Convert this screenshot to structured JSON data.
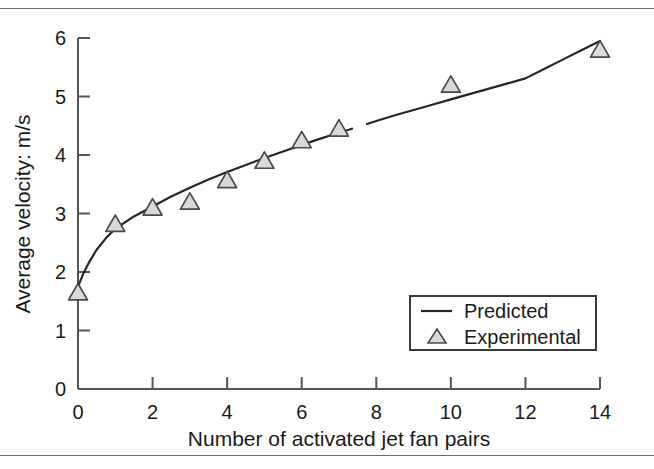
{
  "figure": {
    "background_color": "#ffffff",
    "rule_color": "#6e6e6e",
    "axis_color": "#555555",
    "curve_color": "#262626",
    "marker_fill": "#d9d9d9",
    "marker_stroke": "#4a4a4a"
  },
  "chart_data": {
    "type": "line",
    "title": "",
    "xlabel": "Number of activated jet fan pairs",
    "ylabel": "Average velocity: m/s",
    "xlim": [
      0,
      14
    ],
    "ylim": [
      0,
      6
    ],
    "xticks": [
      0,
      2,
      4,
      6,
      8,
      10,
      12,
      14
    ],
    "xticklabels": [
      "0",
      "2",
      "4",
      "6",
      "8",
      "10",
      "12",
      "14"
    ],
    "yticks": [
      0,
      1,
      2,
      3,
      4,
      5,
      6
    ],
    "yticklabels": [
      "0",
      "1",
      "2",
      "3",
      "4",
      "5",
      "6"
    ],
    "grid": false,
    "legend_position": "lower right",
    "series": [
      {
        "name": "Predicted",
        "marker": "none",
        "style": "solid-line",
        "x": [
          0.0,
          0.15,
          0.3,
          0.5,
          0.75,
          1.0,
          1.5,
          2.0,
          2.5,
          3.0,
          3.5,
          4.0,
          4.5,
          5.0,
          5.5,
          6.0,
          6.5,
          7.0,
          7.5,
          8.0,
          8.5,
          9.0,
          9.5,
          10.0,
          10.5,
          11.0,
          11.5,
          12.0,
          12.5,
          13.0,
          13.5,
          14.0
        ],
        "y": [
          1.75,
          1.98,
          2.17,
          2.38,
          2.58,
          2.74,
          2.95,
          3.12,
          3.29,
          3.44,
          3.58,
          3.71,
          3.83,
          3.95,
          4.06,
          4.17,
          4.28,
          4.38,
          4.48,
          4.58,
          4.68,
          4.77,
          4.86,
          4.95,
          5.04,
          5.13,
          5.22,
          5.31,
          5.47,
          5.63,
          5.79,
          5.95
        ]
      },
      {
        "name": "Experimental",
        "marker": "triangle-up",
        "style": "markers-only",
        "x": [
          0,
          1,
          2,
          3,
          4,
          5,
          6,
          7,
          10,
          14
        ],
        "y": [
          1.65,
          2.82,
          3.1,
          3.2,
          3.57,
          3.9,
          4.25,
          4.45,
          5.2,
          5.8
        ]
      }
    ],
    "annotations": [
      {
        "type": "curve-gap",
        "x_range": [
          7.35,
          7.75
        ],
        "note": "small break in predicted line"
      }
    ]
  },
  "legend": {
    "entries": [
      {
        "label": "Predicted",
        "symbol": "line"
      },
      {
        "label": "Experimental",
        "symbol": "triangle"
      }
    ]
  }
}
